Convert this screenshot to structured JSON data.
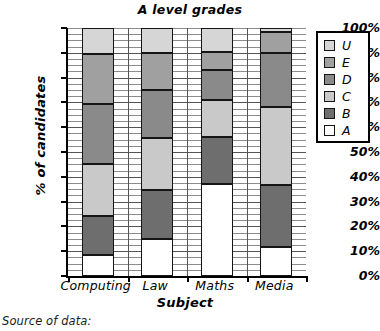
{
  "chart_data": {
    "type": "bar",
    "subtype": "stacked-percentage-column",
    "title": "A level grades",
    "xlabel": "Subject",
    "ylabel": "% of candidates",
    "categories": [
      "Computing",
      "Law",
      "Maths",
      "Media"
    ],
    "ylim": [
      0,
      100
    ],
    "yticks": [
      "0%",
      "10%",
      "20%",
      "30%",
      "40%",
      "50%",
      "60%",
      "70%",
      "80%",
      "90%",
      "100%"
    ],
    "ytick_values": [
      0,
      10,
      20,
      30,
      40,
      50,
      60,
      70,
      80,
      90,
      100
    ],
    "grid": "horizontal-minor-and-major",
    "legend_position": "right-outside",
    "stack_order_bottom_to_top": [
      "A",
      "B",
      "C",
      "D",
      "E",
      "U"
    ],
    "series": [
      {
        "name": "A",
        "color": "#ffffff",
        "values": [
          8.5,
          15.0,
          37.0,
          11.5
        ]
      },
      {
        "name": "B",
        "color": "#6e6e6e",
        "values": [
          15.5,
          19.5,
          19.0,
          25.0
        ]
      },
      {
        "name": "C",
        "color": "#c9c9c9",
        "values": [
          21.0,
          21.0,
          15.0,
          31.5
        ]
      },
      {
        "name": "D",
        "color": "#8a8a8a",
        "values": [
          24.5,
          19.5,
          12.0,
          22.0
        ]
      },
      {
        "name": "E",
        "color": "#a0a0a0",
        "values": [
          20.0,
          15.0,
          7.5,
          8.5
        ]
      },
      {
        "name": "U",
        "color": "#d6d6d6",
        "values": [
          10.5,
          10.0,
          9.5,
          1.5
        ]
      }
    ],
    "cumulative_boundaries": {
      "Computing": [
        8.5,
        24.0,
        45.0,
        69.5,
        89.5,
        100
      ],
      "Law": [
        15.0,
        34.5,
        55.5,
        75.0,
        90.0,
        100
      ],
      "Maths": [
        37.0,
        56.0,
        71.0,
        83.0,
        90.5,
        100
      ],
      "Media": [
        11.5,
        36.5,
        68.0,
        90.0,
        98.5,
        100
      ]
    }
  },
  "legend": {
    "items": [
      {
        "label": "U",
        "color": "#d6d6d6"
      },
      {
        "label": "E",
        "color": "#a0a0a0"
      },
      {
        "label": "D",
        "color": "#8a8a8a"
      },
      {
        "label": "C",
        "color": "#c9c9c9"
      },
      {
        "label": "B",
        "color": "#6e6e6e"
      },
      {
        "label": "A",
        "color": "#ffffff"
      }
    ]
  },
  "footer": {
    "source_note": "Source of data:"
  }
}
